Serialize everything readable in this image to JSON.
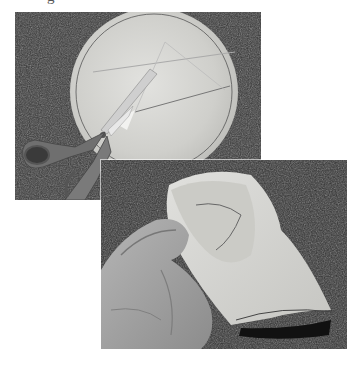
{
  "page": {
    "cutoff_text_fragment": "g"
  },
  "photos": [
    {
      "id": "top",
      "caption_visible": false,
      "subject": "tissue circle on carpet being cut by scissors",
      "icon": "scissors-icon"
    },
    {
      "id": "bottom",
      "caption_visible": false,
      "subject": "hand holding folded cut tissue",
      "icon": "hand-icon"
    }
  ],
  "colors": {
    "background": "#ffffff",
    "carpet": "#3a3a3a",
    "tissue": "#d9d9d6",
    "scissor_handle": "#6e6e6e",
    "skin": "#a9a9a9"
  }
}
